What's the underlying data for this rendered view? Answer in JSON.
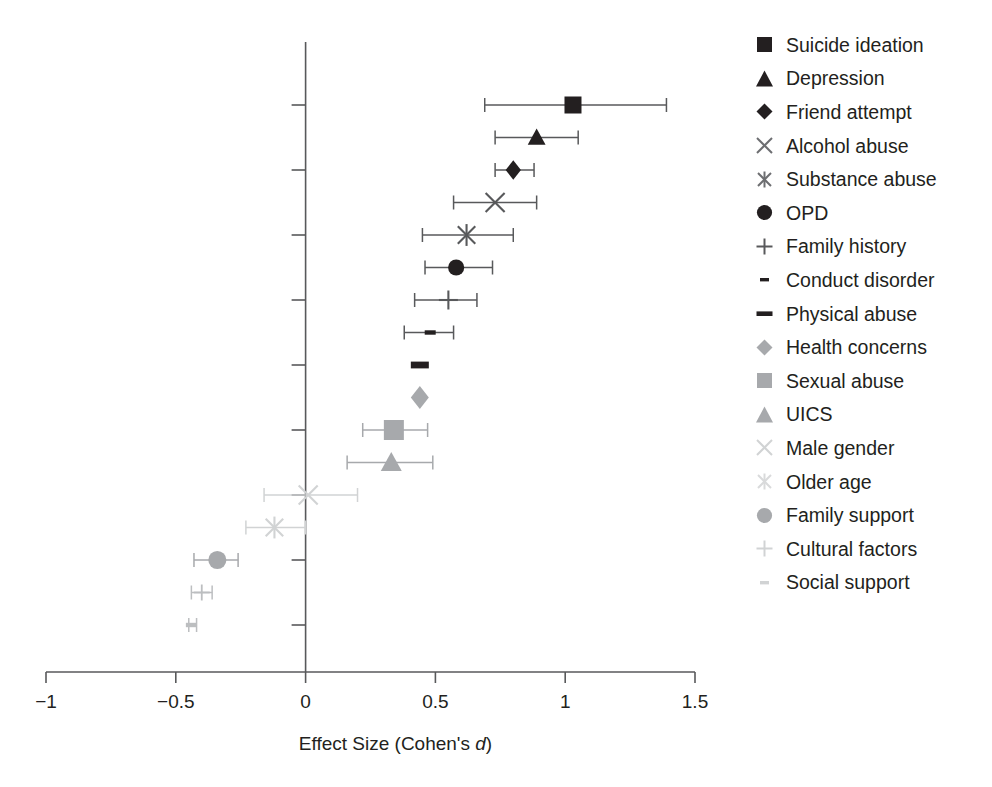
{
  "chart_data": {
    "type": "scatter",
    "title": "",
    "subtitle": "",
    "xlabel_prefix": "Effect Size (Cohen's ",
    "xlabel_italic": "d",
    "xlabel_suffix": ")",
    "xlabel": "Effect Size (Cohen's d)",
    "ylabel": "",
    "xlim": [
      -1,
      1.5
    ],
    "xticks": [
      -1,
      -0.5,
      0,
      0.5,
      1,
      1.5
    ],
    "xticklabels": [
      "−1",
      "−0.5",
      "0",
      "0.5",
      "1",
      "1.5"
    ],
    "grid": false,
    "legend_position": "right",
    "reference_line_x": 0,
    "categories": [
      "Suicide ideation",
      "Depression",
      "Friend attempt",
      "Alcohol abuse",
      "Substance abuse",
      "OPD",
      "Family history",
      "Conduct disorder",
      "Physical abuse",
      "Health concerns",
      "Sexual abuse",
      "UICS",
      "Male gender",
      "Older age",
      "Family support",
      "Cultural factors",
      "Social support"
    ],
    "points": [
      {
        "label": "Suicide ideation",
        "marker": "square",
        "color": "#231f20",
        "size": 17,
        "d": 1.03,
        "ci_low": 0.69,
        "ci_high": 1.39
      },
      {
        "label": "Depression",
        "marker": "triangle",
        "color": "#231f20",
        "size": 17,
        "d": 0.89,
        "ci_low": 0.73,
        "ci_high": 1.05
      },
      {
        "label": "Friend attempt",
        "marker": "diamond",
        "color": "#231f20",
        "size": 17,
        "d": 0.8,
        "ci_low": 0.73,
        "ci_high": 0.88
      },
      {
        "label": "Alcohol abuse",
        "marker": "cross-x",
        "color": "#58595b",
        "size": 19,
        "d": 0.73,
        "ci_low": 0.57,
        "ci_high": 0.89
      },
      {
        "label": "Substance abuse",
        "marker": "asterisk",
        "color": "#58595b",
        "size": 19,
        "d": 0.62,
        "ci_low": 0.45,
        "ci_high": 0.8
      },
      {
        "label": "OPD",
        "marker": "circle",
        "color": "#231f20",
        "size": 17,
        "d": 0.58,
        "ci_low": 0.46,
        "ci_high": 0.72
      },
      {
        "label": "Family history",
        "marker": "plus",
        "color": "#58595b",
        "size": 19,
        "d": 0.55,
        "ci_low": 0.42,
        "ci_high": 0.66
      },
      {
        "label": "Conduct disorder",
        "marker": "dash-sm",
        "color": "#231f20",
        "size": 11,
        "d": 0.48,
        "ci_low": 0.38,
        "ci_high": 0.57
      },
      {
        "label": "Physical abuse",
        "marker": "dash-lg",
        "color": "#231f20",
        "size": 18,
        "d": 0.44,
        "ci_low": 0.44,
        "ci_high": 0.44
      },
      {
        "label": "Health concerns",
        "marker": "diamond",
        "color": "#a7a9ac",
        "size": 20,
        "d": 0.44,
        "ci_low": 0.44,
        "ci_high": 0.44
      },
      {
        "label": "Sexual abuse",
        "marker": "square",
        "color": "#a7a9ac",
        "size": 20,
        "d": 0.34,
        "ci_low": 0.22,
        "ci_high": 0.47
      },
      {
        "label": "UICS",
        "marker": "triangle",
        "color": "#a7a9ac",
        "size": 20,
        "d": 0.33,
        "ci_low": 0.16,
        "ci_high": 0.49
      },
      {
        "label": "Male gender",
        "marker": "cross-x",
        "color": "#d1d3d4",
        "size": 19,
        "d": 0.01,
        "ci_low": -0.16,
        "ci_high": 0.2
      },
      {
        "label": "Older age",
        "marker": "asterisk",
        "color": "#d1d3d4",
        "size": 19,
        "d": -0.12,
        "ci_low": -0.23,
        "ci_high": 0.0
      },
      {
        "label": "Family support",
        "marker": "circle",
        "color": "#a7a9ac",
        "size": 19,
        "d": -0.34,
        "ci_low": -0.43,
        "ci_high": -0.26
      },
      {
        "label": "Cultural factors",
        "marker": "plus",
        "color": "#bcbec0",
        "size": 16,
        "d": -0.4,
        "ci_low": -0.44,
        "ci_high": -0.36
      },
      {
        "label": "Social support",
        "marker": "dash-sm",
        "color": "#bcbec0",
        "size": 11,
        "d": -0.44,
        "ci_low": -0.45,
        "ci_high": -0.42
      }
    ]
  },
  "legend": {
    "items": [
      {
        "label": "Suicide ideation",
        "marker": "square",
        "color": "#231f20"
      },
      {
        "label": "Depression",
        "marker": "triangle",
        "color": "#231f20"
      },
      {
        "label": "Friend attempt",
        "marker": "diamond",
        "color": "#231f20"
      },
      {
        "label": "Alcohol abuse",
        "marker": "cross-x",
        "color": "#6d6e71"
      },
      {
        "label": "Substance abuse",
        "marker": "asterisk",
        "color": "#6d6e71"
      },
      {
        "label": "OPD",
        "marker": "circle",
        "color": "#231f20"
      },
      {
        "label": "Family history",
        "marker": "plus",
        "color": "#58595b"
      },
      {
        "label": "Conduct disorder",
        "marker": "dash-sm",
        "color": "#231f20"
      },
      {
        "label": "Physical abuse",
        "marker": "dash-lg",
        "color": "#231f20"
      },
      {
        "label": "Health concerns",
        "marker": "diamond",
        "color": "#a7a9ac"
      },
      {
        "label": "Sexual abuse",
        "marker": "square",
        "color": "#a7a9ac"
      },
      {
        "label": "UICS",
        "marker": "triangle",
        "color": "#a7a9ac"
      },
      {
        "label": "Male gender",
        "marker": "cross-x",
        "color": "#d1d3d4"
      },
      {
        "label": "Older age",
        "marker": "asterisk",
        "color": "#d9dadb"
      },
      {
        "label": "Family support",
        "marker": "circle",
        "color": "#a7a9ac"
      },
      {
        "label": "Cultural factors",
        "marker": "plus",
        "color": "#d1d3d4"
      },
      {
        "label": "Social support",
        "marker": "dash-sm",
        "color": "#d1d3d4"
      }
    ]
  }
}
